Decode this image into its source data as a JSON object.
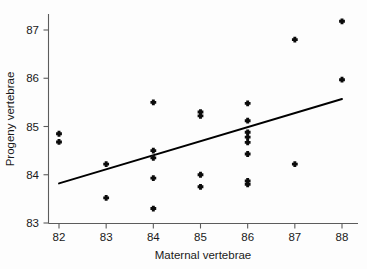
{
  "chart_data": {
    "type": "scatter",
    "title": "",
    "xlabel": "Maternal vertebrae",
    "ylabel": "Progeny vertebrae",
    "xlim": [
      81.6,
      88.5
    ],
    "ylim": [
      83.0,
      87.45
    ],
    "xticks": [
      82,
      83,
      84,
      85,
      86,
      87,
      88
    ],
    "yticks": [
      83,
      84,
      85,
      86,
      87
    ],
    "xtick_labels": [
      "82",
      "83",
      "84",
      "85",
      "86",
      "87",
      "88"
    ],
    "ytick_labels": [
      "83",
      "84",
      "85",
      "86",
      "87"
    ],
    "grid": false,
    "legend": false,
    "marker": "plus-dot",
    "marker_color": "#0b0b0b",
    "line_color": "#000000",
    "points": [
      {
        "x": 82,
        "y": 84.85
      },
      {
        "x": 82,
        "y": 84.68
      },
      {
        "x": 83,
        "y": 84.22
      },
      {
        "x": 83,
        "y": 83.52
      },
      {
        "x": 84,
        "y": 85.5
      },
      {
        "x": 84,
        "y": 84.5
      },
      {
        "x": 84,
        "y": 84.35
      },
      {
        "x": 84,
        "y": 83.93
      },
      {
        "x": 84,
        "y": 83.3
      },
      {
        "x": 85,
        "y": 85.3
      },
      {
        "x": 85,
        "y": 85.22
      },
      {
        "x": 85,
        "y": 84.0
      },
      {
        "x": 85,
        "y": 83.75
      },
      {
        "x": 86,
        "y": 85.48
      },
      {
        "x": 86,
        "y": 85.12
      },
      {
        "x": 86,
        "y": 84.88
      },
      {
        "x": 86,
        "y": 84.78
      },
      {
        "x": 86,
        "y": 84.67
      },
      {
        "x": 86,
        "y": 84.43
      },
      {
        "x": 86,
        "y": 83.87
      },
      {
        "x": 86,
        "y": 83.8
      },
      {
        "x": 87,
        "y": 86.8
      },
      {
        "x": 87,
        "y": 84.22
      },
      {
        "x": 88,
        "y": 87.18
      },
      {
        "x": 88,
        "y": 85.97
      }
    ],
    "fit_line": {
      "name": "regression-line",
      "x_start": 82.0,
      "y_start": 83.82,
      "x_end": 88.0,
      "y_end": 85.57
    }
  }
}
